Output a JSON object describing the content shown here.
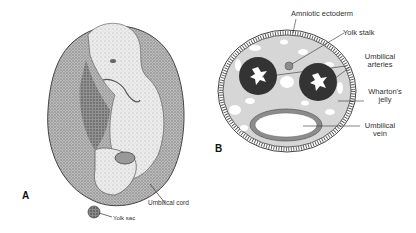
{
  "figure": {
    "panels": [
      {
        "letter": "A",
        "subject": "embryo within amniotic sac",
        "labels": {
          "umbilical_cord": "Umbilical cord",
          "yolk_sac": "Yolk sac"
        }
      },
      {
        "letter": "B",
        "subject": "cross-section of umbilical cord",
        "labels": {
          "amniotic_ectoderm": "Amniotic ectoderm",
          "yolk_stalk": "Yolk stalk",
          "umbilical_arteries_1": "Umbilical",
          "umbilical_arteries_2": "arteries",
          "whartons_jelly_1": "Wharton's",
          "whartons_jelly_2": "jelly",
          "umbilical_vein_1": "Umbilical",
          "umbilical_vein_2": "vein"
        }
      }
    ],
    "colors": {
      "outline": "#333333",
      "jelly": "#d6d6d6",
      "artery": "#333333",
      "vein_wall": "#8c8c8c",
      "lumen": "#ffffff",
      "sac_shade": "#a8a8a8"
    }
  }
}
